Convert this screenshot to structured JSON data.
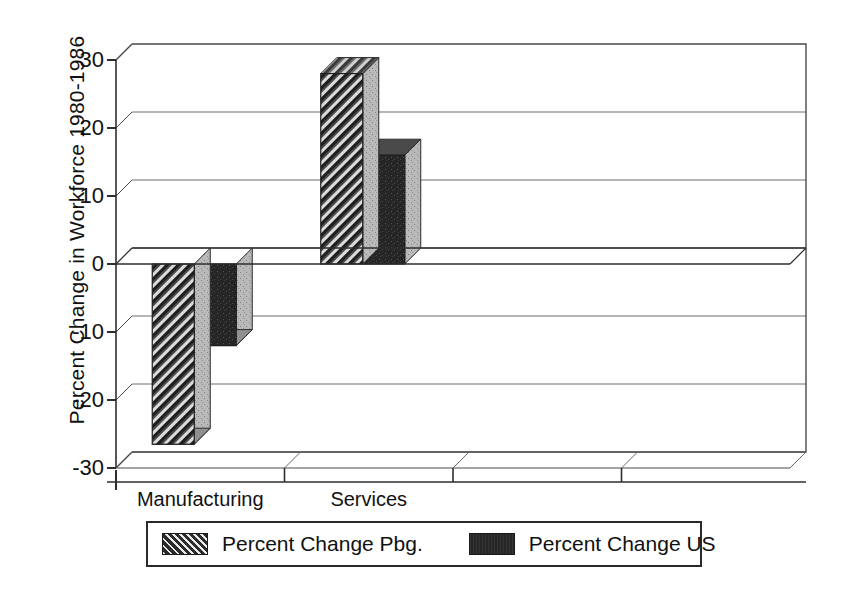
{
  "chart_data": {
    "type": "bar",
    "title": "",
    "subtitle": "",
    "xlabel": "",
    "ylabel": "Percent Change in Workforce 1980-1986",
    "ylim": [
      -30,
      30
    ],
    "ytick_values": [
      30,
      20,
      10,
      0,
      -10,
      -20,
      -30
    ],
    "ytick_labels": [
      "30",
      "20",
      "10",
      "0",
      "-10",
      "-20",
      "-30"
    ],
    "grid": true,
    "grid_axis": "y",
    "legend_position": "bottom",
    "style": "3d-bar",
    "categories": [
      "Manufacturing",
      "Services"
    ],
    "category_slots": [
      "Manufacturing",
      "Services",
      "",
      ""
    ],
    "series": [
      {
        "name": "Percent Change Pbg.",
        "fill": "hatch-diagonal",
        "color": "#2b2b2b",
        "values": [
          -26.5,
          28
        ]
      },
      {
        "name": "Percent Change US",
        "fill": "solid",
        "color": "#262626",
        "values": [
          -12,
          16
        ]
      }
    ]
  },
  "axis": {
    "y_title": "Percent Change in Workforce 1980-1986",
    "zero_line_value": 0
  },
  "legend": {
    "entries": [
      {
        "label": "Percent Change Pbg.",
        "swatch": "hatch-swatch"
      },
      {
        "label": "Percent Change US",
        "swatch": "solid-swatch"
      }
    ]
  }
}
